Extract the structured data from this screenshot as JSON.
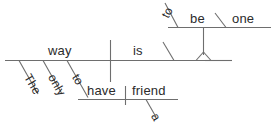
{
  "diagram": {
    "type": "reed-kellogg-sentence-diagram",
    "sentence": "The only way to have a friend is to be one",
    "stroke_color": "#6e6e6e",
    "text_color": "#2b2b2b",
    "background_color": "#ffffff",
    "words": {
      "subject": "way",
      "subject_article": "The",
      "subject_adjective": "only",
      "infinitive_marker_lower": "to",
      "infinitive_verb_lower": "have",
      "infinitive_object": "friend",
      "infinitive_object_article": "a",
      "main_verb": "is",
      "infinitive_marker_upper": "to",
      "infinitive_verb_upper": "be",
      "predicate_complement": "one"
    },
    "labels": {
      "the": "The",
      "only": "only",
      "way": "way",
      "to_lower": "to",
      "have": "have",
      "a": "a",
      "friend": "friend",
      "is": "is",
      "to_upper": "to",
      "be": "be",
      "one": "one"
    }
  }
}
